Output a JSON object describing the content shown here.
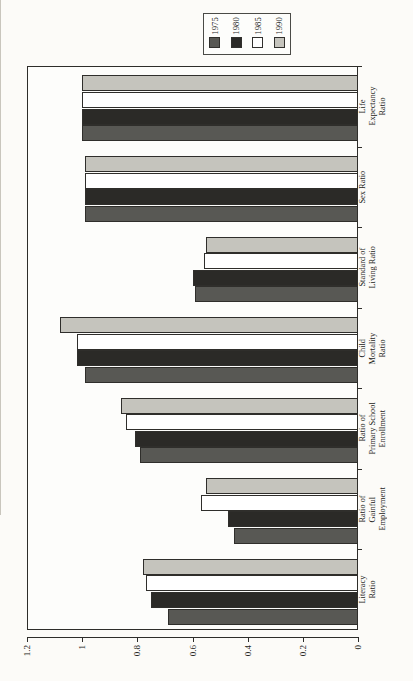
{
  "legend": {
    "entries": [
      {
        "label": "1975",
        "color": "#585854",
        "swatch": "swatch-1975"
      },
      {
        "label": "1980",
        "color": "#2b2a27",
        "swatch": "swatch-1980"
      },
      {
        "label": "1985",
        "color": "#ffffff",
        "swatch": "swatch-1985"
      },
      {
        "label": "1990",
        "color": "#c5c4bd",
        "swatch": "swatch-1990"
      }
    ]
  },
  "axis": {
    "ticks": [
      "1.2",
      "1",
      "0.8",
      "0.6",
      "0.4",
      "0.2",
      "0"
    ],
    "tick_values": [
      1.2,
      1.0,
      0.8,
      0.6,
      0.4,
      0.2,
      0.0
    ],
    "max": 1.2,
    "min": 0
  },
  "categories": [
    "Life\nExpectancy\nRatio",
    "Sex Ratio",
    "Standard of\nLiving Ratio",
    "Child\nMortality\nRatio",
    "Ratio of\nPrimary School\nEnrollment",
    "Ratio of\nGainful\nEmployment",
    "Literacy\nRatio"
  ],
  "chart_data": {
    "type": "bar",
    "orientation": "horizontal",
    "title": "",
    "xlabel": "",
    "ylabel": "",
    "xlim": [
      0,
      1.2
    ],
    "grid": false,
    "legend_position": "top",
    "categories": [
      "Life Expectancy Ratio",
      "Sex Ratio",
      "Standard of Living Ratio",
      "Child Mortality Ratio",
      "Ratio of Primary School Enrollment",
      "Ratio of Gainful Employment",
      "Literacy Ratio"
    ],
    "series": [
      {
        "name": "1975",
        "color": "#585854",
        "values": [
          1.0,
          0.99,
          0.59,
          0.99,
          0.79,
          0.45,
          0.69
        ]
      },
      {
        "name": "1980",
        "color": "#2b2a27",
        "values": [
          1.0,
          0.99,
          0.6,
          1.02,
          0.81,
          0.47,
          0.75
        ]
      },
      {
        "name": "1985",
        "color": "#ffffff",
        "values": [
          1.0,
          0.99,
          0.56,
          1.02,
          0.84,
          0.57,
          0.77
        ]
      },
      {
        "name": "1990",
        "color": "#c5c4bd",
        "values": [
          1.0,
          0.99,
          0.55,
          1.08,
          0.86,
          0.55,
          0.78
        ]
      }
    ]
  }
}
